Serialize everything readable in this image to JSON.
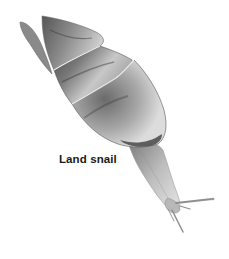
{
  "figure": {
    "label": "Land snail",
    "colors": {
      "background": "#ffffff",
      "shell_dark": "#3a3a3a",
      "shell_mid": "#8a8a8a",
      "shell_light": "#d8d8d8",
      "body": "#b5b5b5",
      "label_text": "#1a1a1a"
    }
  }
}
